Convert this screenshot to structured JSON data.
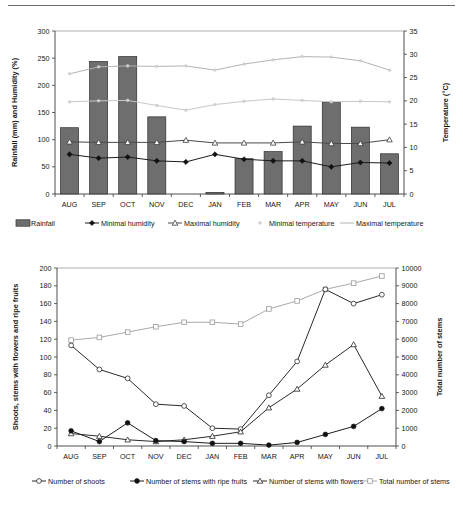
{
  "chart_data": [
    {
      "id": "climate",
      "type": "bar",
      "title": "",
      "categories": [
        "AUG",
        "SEP",
        "OCT",
        "NOV",
        "DEC",
        "JAN",
        "FEB",
        "MAR",
        "APR",
        "MAY",
        "JUN",
        "JUL"
      ],
      "xlabel": "",
      "ylabel": "Rainfall (mm) and Humidity (%)",
      "ylabel_right": "Temperature (°C)",
      "ylim": [
        0,
        300
      ],
      "yticks": [
        0,
        50,
        100,
        150,
        200,
        250,
        300
      ],
      "ylim_right": [
        0,
        35
      ],
      "yticks_right": [
        0,
        5,
        10,
        15,
        20,
        25,
        30,
        35
      ],
      "grid": false,
      "legend_position": "bottom",
      "series": [
        {
          "name": "Rainfall",
          "kind": "bar",
          "axis": "left",
          "unit": "mm",
          "values": [
            122,
            244,
            253,
            142,
            0,
            3,
            65,
            78,
            125,
            169,
            123,
            74
          ]
        },
        {
          "name": "Minimal humidity",
          "kind": "line",
          "axis": "left",
          "unit": "%",
          "values": [
            73,
            66,
            68,
            61,
            59,
            73,
            64,
            61,
            61,
            50,
            58,
            57
          ]
        },
        {
          "name": "Maximal humidity",
          "kind": "line",
          "axis": "left",
          "unit": "%",
          "values": [
            96,
            95,
            95,
            95,
            99,
            94,
            94,
            94,
            96,
            93,
            93,
            100
          ]
        },
        {
          "name": "Minimal temperature",
          "kind": "line",
          "axis": "right",
          "unit": "°C",
          "values": [
            19.8,
            20.0,
            20.1,
            19.0,
            18.0,
            19.2,
            19.9,
            20.4,
            20.1,
            19.8,
            19.9,
            19.8
          ]
        },
        {
          "name": "Maximal temperature",
          "kind": "line",
          "axis": "right",
          "unit": "°C",
          "values": [
            25.8,
            27.3,
            27.5,
            27.4,
            27.5,
            26.6,
            27.9,
            28.8,
            29.5,
            29.4,
            28.6,
            26.6
          ]
        }
      ],
      "legend": [
        "Rainfall",
        "Minimal humidity",
        "Maximal humidity",
        "Minimal temperature",
        "Maximal temperature"
      ]
    },
    {
      "id": "phenology",
      "type": "line",
      "title": "",
      "categories": [
        "AUG",
        "SEP",
        "OCT",
        "NOV",
        "DEC",
        "JAN",
        "FEB",
        "MAR",
        "APR",
        "MAY",
        "JUN",
        "JUL"
      ],
      "xlabel": "",
      "ylabel": "Shoots, stems with flowers and ripe fruits",
      "ylabel_right": "Total number of stems",
      "ylim": [
        0,
        200
      ],
      "yticks": [
        0,
        20,
        40,
        60,
        80,
        100,
        120,
        140,
        160,
        180,
        200
      ],
      "ylim_right": [
        0,
        10000
      ],
      "yticks_right": [
        0,
        1000,
        2000,
        3000,
        4000,
        5000,
        6000,
        7000,
        8000,
        9000,
        10000
      ],
      "grid": false,
      "legend_position": "bottom",
      "series": [
        {
          "name": "Number of shoots",
          "axis": "left",
          "values": [
            113,
            86,
            76,
            47,
            45,
            20,
            19,
            57,
            95,
            176,
            160,
            170
          ]
        },
        {
          "name": "Number of stems with ripe fruits",
          "axis": "left",
          "values": [
            17,
            5,
            26,
            6,
            5,
            3,
            3,
            1,
            4,
            13,
            22,
            42
          ]
        },
        {
          "name": "Number of stems with flowers",
          "axis": "left",
          "values": [
            14,
            11,
            7,
            5,
            7,
            11,
            16,
            43,
            64,
            91,
            114,
            56
          ]
        },
        {
          "name": "Total number of stems",
          "axis": "right",
          "values": [
            5950,
            6100,
            6400,
            6700,
            6950,
            6950,
            6850,
            7700,
            8150,
            8800,
            9150,
            9550
          ]
        }
      ],
      "legend": [
        "Number of shoots",
        "Number of stems with ripe fruits",
        "Number of stems with flowers",
        "Total number of stems"
      ]
    }
  ]
}
